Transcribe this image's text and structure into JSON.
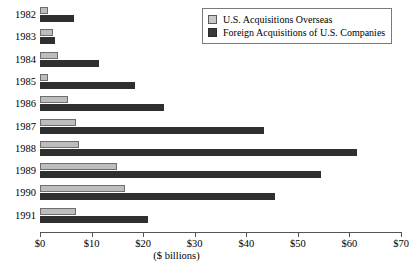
{
  "chart_data": {
    "type": "bar",
    "orientation": "horizontal",
    "title": "",
    "xlabel": "($  billions)",
    "ylabel": "",
    "xlim": [
      0,
      70
    ],
    "xticks": [
      "$0",
      "$10",
      "$20",
      "$30",
      "$40",
      "$50",
      "$60",
      "$70"
    ],
    "xtick_values": [
      0,
      10,
      20,
      30,
      40,
      50,
      60,
      70
    ],
    "categories": [
      "1982",
      "1983",
      "1984",
      "1985",
      "1986",
      "1987",
      "1988",
      "1989",
      "1990",
      "1991"
    ],
    "grid": false,
    "legend_position": "top-right",
    "series": [
      {
        "name": "U.S. Acquisitions Overseas",
        "color": "#bdbdbd",
        "values": [
          1.5,
          2.5,
          3.5,
          1.5,
          5.5,
          7.0,
          7.5,
          15.0,
          16.5,
          7.0
        ]
      },
      {
        "name": "Foreign Acquisitions of U.S. Companies",
        "color": "#2f2f2f",
        "values": [
          6.5,
          3.0,
          11.5,
          18.5,
          24.0,
          43.5,
          61.5,
          54.5,
          45.5,
          21.0
        ]
      }
    ]
  },
  "legend": {
    "entries": [
      {
        "label": "U.S. Acquisitions Overseas",
        "swatch": "light-swatch"
      },
      {
        "label": "Foreign Acquisitions of U.S. Companies",
        "swatch": "dark-swatch"
      }
    ]
  }
}
